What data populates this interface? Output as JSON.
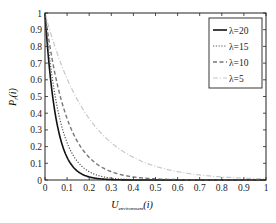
{
  "chart_data": {
    "type": "line",
    "title": "",
    "xlabel": "U_environment(i)",
    "xlabel_main": "U",
    "xlabel_sub": "environment",
    "xlabel_tail": "(i)",
    "ylabel": "P_r(i)",
    "ylabel_main": "P",
    "ylabel_sub": "r",
    "ylabel_tail": "(i)",
    "xlim": [
      0,
      1
    ],
    "ylim": [
      0,
      1
    ],
    "xticks": [
      "0",
      "0.1",
      "0.2",
      "0.3",
      "0.4",
      "0.5",
      "0.6",
      "0.7",
      "0.8",
      "0.9",
      "1"
    ],
    "yticks": [
      "0",
      "0.1",
      "0.2",
      "0.3",
      "0.4",
      "0.5",
      "0.6",
      "0.7",
      "0.8",
      "0.9",
      "1"
    ],
    "grid": false,
    "legend_position": "upper right",
    "function": "exp(-lambda * x)",
    "x": [
      0,
      0.05,
      0.1,
      0.15,
      0.2,
      0.3,
      0.4,
      0.5,
      0.6,
      0.7,
      0.8,
      0.9,
      1.0
    ],
    "series": [
      {
        "name": "λ=20",
        "lambda": 20,
        "style": "solid",
        "color": "#111111",
        "width": 1.6,
        "values": [
          1,
          0.368,
          0.135,
          0.05,
          0.018,
          0.002,
          0,
          0,
          0,
          0,
          0,
          0,
          0
        ]
      },
      {
        "name": "λ=15",
        "lambda": 15,
        "style": "dotted",
        "color": "#555555",
        "width": 1.2,
        "values": [
          1,
          0.472,
          0.223,
          0.105,
          0.05,
          0.011,
          0.002,
          0.001,
          0,
          0,
          0,
          0,
          0
        ]
      },
      {
        "name": "λ=10",
        "lambda": 10,
        "style": "dashed",
        "color": "#777777",
        "width": 1.4,
        "values": [
          1,
          0.607,
          0.368,
          0.223,
          0.135,
          0.05,
          0.018,
          0.007,
          0.002,
          0.001,
          0,
          0,
          0
        ]
      },
      {
        "name": "λ=5",
        "lambda": 5,
        "style": "dashdot",
        "color": "#c8c8c8",
        "width": 1.2,
        "values": [
          1,
          0.779,
          0.607,
          0.472,
          0.368,
          0.223,
          0.135,
          0.082,
          0.05,
          0.03,
          0.018,
          0.011,
          0.007
        ]
      }
    ]
  }
}
